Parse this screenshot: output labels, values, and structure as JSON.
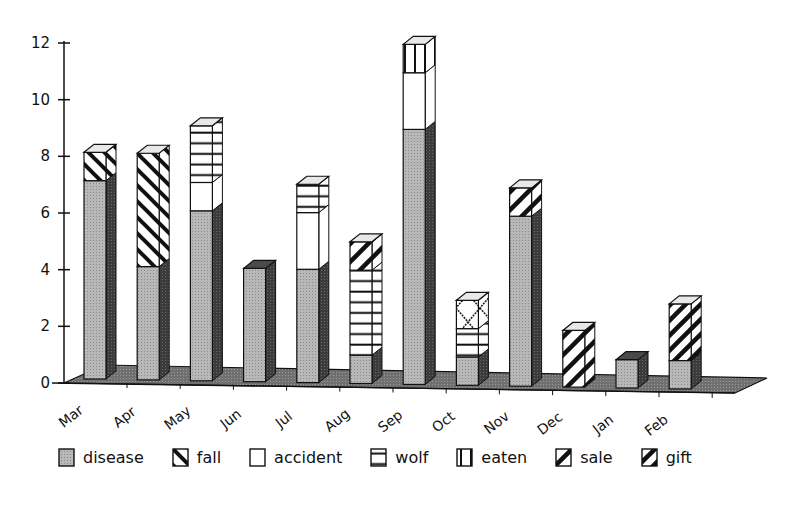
{
  "chart_data": {
    "type": "bar",
    "subtype": "stacked-3d",
    "title": "",
    "xlabel": "",
    "ylabel": "",
    "ylim": [
      0,
      12
    ],
    "yticks": [
      0,
      2,
      4,
      6,
      8,
      10,
      12
    ],
    "grid": false,
    "legend_position": "bottom",
    "categories": [
      "Mar",
      "Apr",
      "May",
      "Jun",
      "Jul",
      "Aug",
      "Sep",
      "Oct",
      "Nov",
      "Dec",
      "Jan",
      "Feb"
    ],
    "series": [
      {
        "name": "disease",
        "pattern": "grey-dots",
        "values": [
          7,
          4,
          6,
          4,
          4,
          1,
          9,
          1,
          6,
          0,
          1,
          1
        ]
      },
      {
        "name": "fall",
        "pattern": "back-diagonal",
        "values": [
          1,
          4,
          0,
          0,
          0,
          0,
          0,
          0,
          0,
          0,
          0,
          0
        ]
      },
      {
        "name": "accident",
        "pattern": "blank",
        "values": [
          0,
          0,
          1,
          0,
          2,
          0,
          2,
          0,
          0,
          0,
          0,
          0
        ]
      },
      {
        "name": "wolf",
        "pattern": "horizontal",
        "values": [
          0,
          0,
          2,
          0,
          1,
          3,
          0,
          1,
          0,
          0,
          0,
          0
        ]
      },
      {
        "name": "eaten",
        "pattern": "vertical",
        "values": [
          0,
          0,
          0,
          0,
          0,
          0,
          1,
          0,
          0,
          0,
          0,
          0
        ]
      },
      {
        "name": "sale",
        "pattern": "forward-diagonal",
        "values": [
          0,
          0,
          0,
          0,
          0,
          1,
          0,
          0,
          1,
          2,
          0,
          0
        ]
      },
      {
        "name": "gift",
        "pattern": "forward-diagonal-dense",
        "values": [
          0,
          0,
          0,
          0,
          0,
          0,
          0,
          0,
          0,
          0,
          0,
          2
        ]
      },
      {
        "name": "(unlabeled cross-hatch)",
        "pattern": "cross",
        "values": [
          0,
          0,
          0,
          0,
          0,
          0,
          0,
          1,
          0,
          0,
          0,
          0
        ]
      }
    ],
    "totals": [
      8,
      8,
      9,
      4,
      7,
      5,
      12,
      3,
      7,
      2,
      1,
      3
    ]
  },
  "legend": {
    "items": [
      {
        "label": "disease",
        "pattern": "grey-dots"
      },
      {
        "label": "fall",
        "pattern": "back-diagonal"
      },
      {
        "label": "accident",
        "pattern": "blank"
      },
      {
        "label": "wolf",
        "pattern": "horizontal"
      },
      {
        "label": "eaten",
        "pattern": "vertical"
      },
      {
        "label": "sale",
        "pattern": "forward-diagonal"
      },
      {
        "label": "gift",
        "pattern": "forward-diagonal-dense"
      }
    ]
  },
  "colors": {
    "disease": "#b4b4b4",
    "disease_side": "#3a3a3a",
    "floor": "#6e6e6e",
    "ink": "#111111"
  }
}
